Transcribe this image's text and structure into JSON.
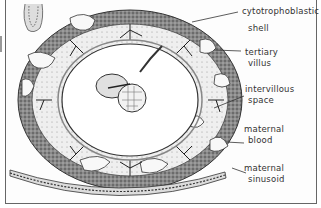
{
  "figure": {
    "type": "histology illustration",
    "labels": [
      {
        "id": "cytotrophoblastic-shell",
        "line1": "cytotrophoblastic",
        "line2": "shell"
      },
      {
        "id": "tertiary-villus",
        "line1": "tertiary",
        "line2": "villus"
      },
      {
        "id": "intervillous-space",
        "line1": "intervillous",
        "line2": "space"
      },
      {
        "id": "maternal-blood",
        "line1": "maternal",
        "line2": "blood"
      },
      {
        "id": "maternal-sinusoid",
        "line1": "maternal",
        "line2": "sinusoid"
      }
    ]
  }
}
